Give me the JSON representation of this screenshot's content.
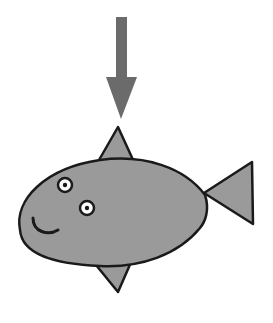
{
  "scene": {
    "description": "Cartoon fish with downward arrow pointing at its dorsal fin",
    "colors": {
      "background": "#ffffff",
      "arrow": "#6b6b6b",
      "fish_body": "#9a9a9a",
      "outline": "#1a1a1a",
      "eye_white": "#ffffff"
    },
    "elements": [
      "arrow-down",
      "fish-body",
      "dorsal-fin",
      "tail-fin",
      "pelvic-fin",
      "eye-left",
      "eye-right",
      "smile"
    ]
  }
}
